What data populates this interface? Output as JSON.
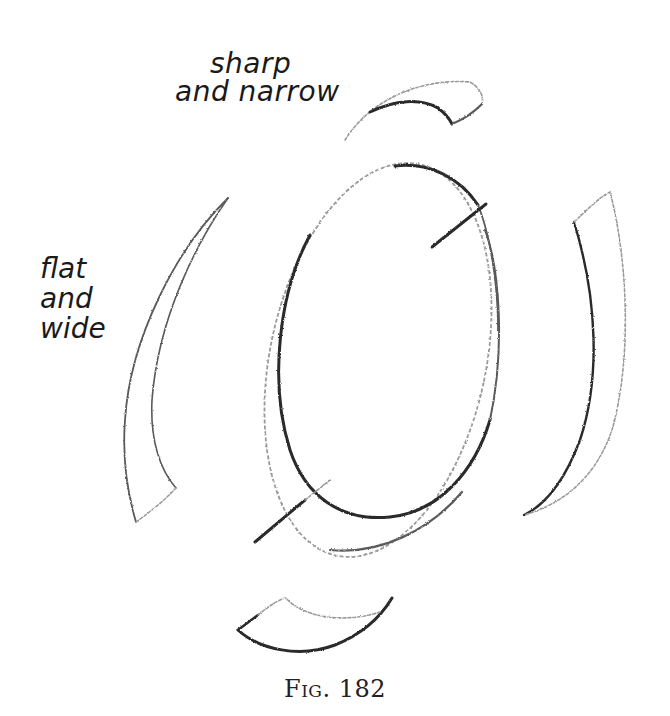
{
  "figure": {
    "caption": "Fig. 182",
    "labels": {
      "top": {
        "line1": "sharp",
        "line2": "and narrow"
      },
      "left": {
        "line1": "flat",
        "line2": "and",
        "line3": "wide"
      }
    },
    "elements": [
      {
        "name": "central-ellipse",
        "description": "tilted oval drawn in pencil with an offset ghost outline"
      },
      {
        "name": "axis-line",
        "description": "diagonal line crossing the oval at top-right and bottom-left"
      },
      {
        "name": "top-arc",
        "description": "sharp and narrow curved stroke above the oval"
      },
      {
        "name": "bottom-arc",
        "description": "curved stroke below the oval"
      },
      {
        "name": "left-arc",
        "description": "flat and wide curved stroke left of the oval"
      },
      {
        "name": "right-arc",
        "description": "curved stroke right of the oval"
      }
    ],
    "colors": {
      "background": "#ffffff",
      "pencil_dark": "#2a2a2a",
      "pencil_light": "#9a9a9a",
      "text": "#1a1a1a"
    }
  }
}
